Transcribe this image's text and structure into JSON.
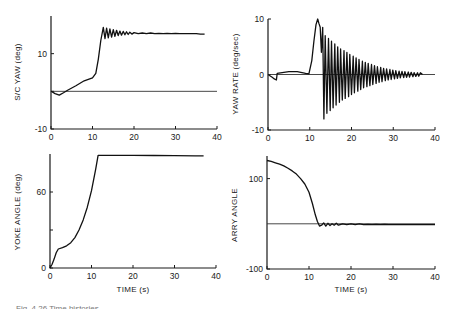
{
  "chart_data": [
    {
      "id": "sc-yaw",
      "type": "line",
      "title": "",
      "xlabel": "",
      "ylabel": "S/C YAW (deg)",
      "xlim": [
        0,
        40
      ],
      "ylim": [
        -10,
        20
      ],
      "xticks": [
        0,
        10,
        20,
        30,
        40
      ],
      "yticks": [
        {
          "v": 10,
          "label": "10"
        },
        {
          "v": -10,
          "label": "-10"
        }
      ],
      "extra_yticks": [
        0
      ],
      "reference_line": 0,
      "series": [
        {
          "name": "S/C YAW",
          "x": [
            0,
            1,
            2,
            3,
            4,
            6,
            8,
            10,
            10.8,
            11.4,
            12,
            12.6,
            13.0,
            13.4,
            13.8,
            14.2,
            14.6,
            15.0,
            15.4,
            15.8,
            16.2,
            16.6,
            17.0,
            17.4,
            17.8,
            18.2,
            18.6,
            19.0,
            19.5,
            20,
            21,
            22,
            23,
            24,
            25,
            26,
            27,
            28,
            29,
            30,
            31,
            32,
            33,
            34,
            35,
            36,
            37
          ],
          "y": [
            0,
            -0.6,
            -1.0,
            -0.4,
            0.3,
            1.5,
            2.8,
            3.6,
            4.8,
            8.5,
            13.5,
            17.0,
            14.0,
            16.8,
            14.2,
            16.6,
            14.4,
            16.4,
            14.6,
            16.2,
            14.8,
            16.0,
            14.9,
            15.9,
            15.0,
            15.8,
            15.1,
            15.7,
            15.2,
            15.6,
            15.3,
            15.5,
            15.3,
            15.5,
            15.3,
            15.4,
            15.3,
            15.4,
            15.3,
            15.4,
            15.3,
            15.3,
            15.3,
            15.3,
            15.3,
            15.2,
            15.2
          ]
        }
      ]
    },
    {
      "id": "yaw-rate",
      "type": "line",
      "title": "",
      "xlabel": "",
      "ylabel": "YAW RATE (deg/sec)",
      "xlim": [
        0,
        40
      ],
      "ylim": [
        -10,
        10
      ],
      "xticks": [
        0,
        10,
        20,
        30,
        40
      ],
      "yticks": [
        {
          "v": 10,
          "label": "10"
        },
        {
          "v": 0,
          "label": "0"
        },
        {
          "v": -10,
          "label": "-10"
        }
      ],
      "reference_line": 0,
      "series": [
        {
          "name": "YAW RATE",
          "envelope_description": "Spike to ~10 deg/sec near t=12 s, then damped oscillation about 0 decaying to ~0.3 by t=37 s",
          "x": [
            0,
            1,
            1.5,
            2,
            2.2,
            3,
            5,
            7,
            9,
            9.8,
            10.5,
            11,
            11.5,
            11.9,
            12.2,
            12.5,
            12.8,
            13.1,
            13.4,
            13.7,
            14.1,
            14.5,
            14.9,
            15.2,
            15.6,
            16.0,
            16.3,
            16.7,
            17.1,
            17.4,
            17.8,
            18.2,
            18.5,
            18.9,
            19.3,
            19.6,
            20.0,
            20.4,
            20.7,
            21.1,
            21.5,
            21.8,
            22.2,
            22.6,
            22.9,
            23.3,
            23.7,
            24.0,
            24.4,
            24.8,
            25.1,
            25.5,
            25.9,
            26.2,
            26.6,
            27.0,
            27.3,
            27.7,
            28.1,
            28.4,
            28.8,
            29.2,
            29.5,
            29.9,
            30.3,
            30.6,
            31.0,
            31.4,
            31.7,
            32.1,
            32.5,
            32.8,
            33.2,
            33.6,
            33.9,
            34.3,
            34.7,
            35.0,
            35.4,
            35.8,
            36.1,
            36.5,
            37
          ],
          "y": [
            0,
            -0.5,
            -0.8,
            -1.0,
            0.2,
            0.3,
            0.5,
            0.5,
            0.2,
            0.1,
            2.5,
            6.0,
            9.0,
            10.0,
            9.2,
            8.5,
            4.0,
            8.5,
            -8.0,
            7.0,
            -7.0,
            6.5,
            -6.5,
            6.0,
            -6.0,
            5.5,
            -5.5,
            5.0,
            -5.0,
            4.6,
            -4.6,
            4.3,
            -4.3,
            4.0,
            -4.0,
            3.6,
            -3.6,
            3.3,
            -3.3,
            3.0,
            -3.0,
            2.7,
            -2.7,
            2.4,
            -2.4,
            2.2,
            -2.2,
            2.0,
            -2.0,
            1.8,
            -1.8,
            1.6,
            -1.6,
            1.4,
            -1.4,
            1.3,
            -1.3,
            1.1,
            -1.1,
            1.0,
            -1.0,
            0.9,
            -0.9,
            0.8,
            -0.8,
            0.7,
            -0.7,
            0.6,
            -0.6,
            0.55,
            -0.55,
            0.5,
            -0.5,
            0.45,
            -0.45,
            0.4,
            -0.4,
            0.35,
            -0.35,
            0.3,
            -0.3,
            0.3,
            0
          ]
        }
      ]
    },
    {
      "id": "yoke-angle",
      "type": "line",
      "title": "",
      "xlabel": "TIME (s)",
      "ylabel": "YOKE ANGLE (deg)",
      "xlim": [
        0,
        40
      ],
      "ylim": [
        0,
        90
      ],
      "xticks": [
        0,
        10,
        20,
        30,
        40
      ],
      "yticks": [
        {
          "v": 60,
          "label": "60"
        },
        {
          "v": 0,
          "label": "0"
        }
      ],
      "extra_yticks": [
        30
      ],
      "series": [
        {
          "name": "YOKE ANGLE",
          "x": [
            0,
            0.5,
            1,
            1.5,
            2,
            3,
            4,
            5,
            6,
            7,
            8,
            9,
            10,
            11,
            11.6,
            12,
            15,
            20,
            25,
            30,
            35,
            37
          ],
          "y": [
            0,
            3,
            7,
            12,
            15,
            16,
            17.5,
            20,
            24,
            30,
            38,
            48,
            61,
            78,
            89,
            89,
            89,
            89,
            88.8,
            88.7,
            88.5,
            88.5
          ]
        }
      ]
    },
    {
      "id": "arry-angle",
      "type": "line",
      "title": "",
      "xlabel": "TIME (s)",
      "ylabel": "ARRY ANGLE",
      "xlim": [
        0,
        40
      ],
      "ylim": [
        -100,
        150
      ],
      "xticks": [
        0,
        10,
        20,
        30,
        40
      ],
      "yticks": [
        {
          "v": 100,
          "label": "100"
        },
        {
          "v": -100,
          "label": "-100"
        }
      ],
      "reference_line": 0,
      "series": [
        {
          "name": "ARRY ANGLE",
          "x": [
            0,
            1,
            2,
            3,
            4,
            5,
            6,
            7,
            8,
            9,
            10,
            10.8,
            11.5,
            12,
            12.5,
            13,
            13.5,
            14,
            14.5,
            15,
            15.5,
            16,
            16.5,
            17,
            18,
            19,
            20,
            21,
            22,
            23,
            24,
            25,
            26,
            27,
            28,
            29,
            30,
            35,
            40
          ],
          "y": [
            140,
            138,
            135,
            132,
            128,
            123,
            117,
            110,
            100,
            88,
            70,
            45,
            20,
            5,
            -5,
            -3,
            2,
            -5,
            1,
            -4,
            0,
            -3,
            1,
            -3,
            0,
            -2,
            0,
            -2,
            0,
            -2,
            -1,
            -2,
            -1,
            -2,
            -1,
            -2,
            -2,
            -2,
            -2
          ]
        }
      ]
    }
  ],
  "panels": {
    "tl": {
      "ylabel": "S/C YAW (deg)",
      "xlabel": ""
    },
    "tr": {
      "ylabel": "YAW RATE (deg/sec)",
      "xlabel": ""
    },
    "bl": {
      "ylabel": "YOKE ANGLE (deg)",
      "xlabel": "TIME (s)"
    },
    "br": {
      "ylabel": "ARRY ANGLE",
      "xlabel": "TIME (s)"
    }
  },
  "caption": "Fig. 4.26   Time histories ..."
}
